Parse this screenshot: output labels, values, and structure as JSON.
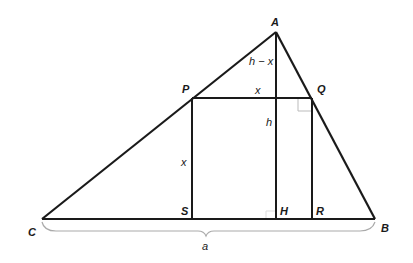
{
  "diagram": {
    "type": "geometry",
    "colors": {
      "stroke": "#1a1a1a",
      "marker": "#bbbbbb",
      "background": "#ffffff"
    },
    "points": {
      "A": {
        "label": "A",
        "x": 276,
        "y": 32
      },
      "B": {
        "label": "B",
        "x": 375,
        "y": 219
      },
      "C": {
        "label": "C",
        "x": 42,
        "y": 219
      },
      "P": {
        "label": "P",
        "x": 192,
        "y": 98
      },
      "Q": {
        "label": "Q",
        "x": 312,
        "y": 98
      },
      "R": {
        "label": "R",
        "x": 312,
        "y": 219
      },
      "S": {
        "label": "S",
        "x": 192,
        "y": 219
      },
      "H": {
        "label": "H",
        "x": 276,
        "y": 219
      }
    },
    "labels": {
      "h_minus_x": "h − x",
      "x_top": "x",
      "x_side": "x",
      "h": "h",
      "a": "a"
    },
    "segments": [
      [
        "C",
        "A"
      ],
      [
        "A",
        "B"
      ],
      [
        "C",
        "B"
      ],
      [
        "P",
        "Q"
      ],
      [
        "P",
        "S"
      ],
      [
        "Q",
        "R"
      ],
      [
        "A",
        "H"
      ]
    ],
    "right_angle_markers": [
      "Q",
      "H"
    ],
    "brace": {
      "from": "C",
      "to": "B",
      "label": "a"
    }
  }
}
